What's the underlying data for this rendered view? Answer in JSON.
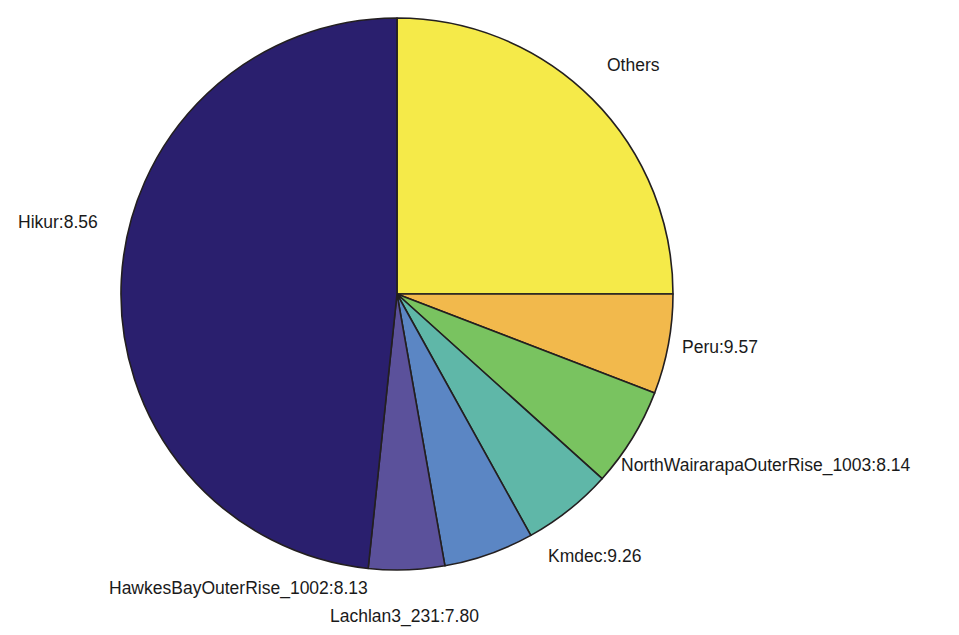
{
  "chart_data": {
    "type": "pie",
    "title": "",
    "subtitle": "",
    "xlabel": "",
    "ylabel": "",
    "legend_position": "none",
    "grid": false,
    "start_angle_deg": 0,
    "direction": "clockwise",
    "categories": [
      "Others",
      "Peru:9.57",
      "NorthWairarapaOuterRise_1003:8.14",
      "Kmdec:9.26",
      "Lachlan3_231:7.80",
      "HawkesBayOuterRise_1002:8.13",
      "Hikur:8.56"
    ],
    "values": [
      25.0,
      5.9,
      5.8,
      5.3,
      5.3,
      4.4,
      48.3
    ],
    "colors": [
      "#f5ea49",
      "#f2b94c",
      "#79c360",
      "#5fb7a8",
      "#5b86c4",
      "#5b519b",
      "#2a1f6e"
    ],
    "slices": [
      {
        "label": "Others",
        "value": 25.0,
        "color": "#f5ea49",
        "start_deg": 0.0,
        "end_deg": 90.0,
        "label_x": 607,
        "label_y": 66,
        "label_anchor": "start"
      },
      {
        "label": "Peru:9.57",
        "value": 5.9,
        "color": "#f2b94c",
        "start_deg": 90.0,
        "end_deg": 111.0,
        "label_x": 682,
        "label_y": 348,
        "label_anchor": "start"
      },
      {
        "label": "NorthWairarapaOuterRise_1003:8.14",
        "value": 5.8,
        "color": "#79c360",
        "start_deg": 111.0,
        "end_deg": 132.0,
        "label_x": 621,
        "label_y": 466,
        "label_anchor": "start"
      },
      {
        "label": "Kmdec:9.26",
        "value": 5.3,
        "color": "#5fb7a8",
        "start_deg": 132.0,
        "end_deg": 151.0,
        "label_x": 548,
        "label_y": 557,
        "label_anchor": "start"
      },
      {
        "label": "Lachlan3_231:7.80",
        "value": 5.3,
        "color": "#5b86c4",
        "start_deg": 151.0,
        "end_deg": 170.0,
        "label_x": 330,
        "label_y": 617,
        "label_anchor": "start"
      },
      {
        "label": "HawkesBayOuterRise_1002:8.13",
        "value": 4.4,
        "color": "#5b519b",
        "start_deg": 170.0,
        "end_deg": 186.0,
        "label_x": 109,
        "label_y": 589,
        "label_anchor": "start"
      },
      {
        "label": "Hikur:8.56",
        "value": 48.3,
        "color": "#2a1f6e",
        "start_deg": 186.0,
        "end_deg": 360.0,
        "label_x": 18,
        "label_y": 223,
        "label_anchor": "start"
      }
    ],
    "geometry": {
      "center_x": 397,
      "center_y": 294,
      "radius": 276
    },
    "style": {
      "background": "#ffffff",
      "slice_border_color": "#231f20",
      "label_color": "#1a1a1a",
      "label_font_size": 17.5
    }
  }
}
